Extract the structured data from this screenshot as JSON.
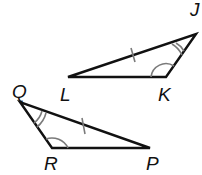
{
  "diagram": {
    "type": "congruent-triangles",
    "triangles": [
      {
        "name": "JKL",
        "vertices": {
          "J": {
            "label": "J",
            "x": 196,
            "y": 34
          },
          "K": {
            "label": "K",
            "x": 166,
            "y": 77
          },
          "L": {
            "label": "L",
            "x": 68,
            "y": 77
          }
        },
        "congruence_marks": {
          "side_tick": "LJ",
          "double_arc_angle": "J",
          "single_arc_angle": "K"
        }
      },
      {
        "name": "QRP",
        "vertices": {
          "Q": {
            "label": "Q",
            "x": 20,
            "y": 102
          },
          "R": {
            "label": "R",
            "x": 52,
            "y": 148
          },
          "P": {
            "label": "P",
            "x": 150,
            "y": 148
          }
        },
        "congruence_marks": {
          "side_tick": "QP",
          "double_arc_angle": "Q",
          "single_arc_angle": "R"
        }
      }
    ],
    "colors": {
      "line": "#111111",
      "mark": "#7a7a7a",
      "background": "#ffffff"
    }
  }
}
